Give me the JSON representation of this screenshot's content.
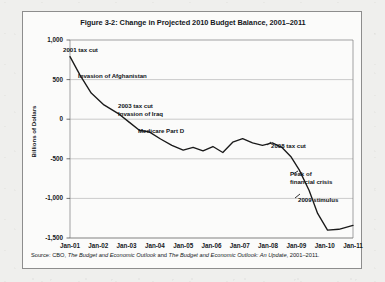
{
  "figure": {
    "title": "Figure 3-2: Change in Projected 2010 Budget Balance, 2001–2011",
    "source_prefix": "Source: CBO, ",
    "source_italic_1": "The Budget and Economic Outlook",
    "source_mid": " and ",
    "source_italic_2": "The Budget and Economic Outlook: An Update",
    "source_suffix": ", 2001–2011."
  },
  "chart_data": {
    "type": "line",
    "title": "Figure 3-2: Change in Projected 2010 Budget Balance, 2001–2011",
    "xlabel": "",
    "ylabel": "Billions of Dollars",
    "ylim": [
      -1500,
      1000
    ],
    "xlim": [
      "Jan-01",
      "Jan-11"
    ],
    "grid": true,
    "legend": "none",
    "line_color": "#1a1a1a",
    "ytick_labels": [
      "1,000",
      "500",
      "0",
      "-500",
      "-1,000",
      "-1,500"
    ],
    "ytick_values": [
      1000,
      500,
      0,
      -500,
      -1000,
      -1500
    ],
    "xtick_labels": [
      "Jan-01",
      "Jan-02",
      "Jan-03",
      "Jan-04",
      "Jan-05",
      "Jan-06",
      "Jan-07",
      "Jan-08",
      "Jan-09",
      "Jan-10",
      "Jan-11"
    ],
    "x": [
      2001.0,
      2001.35,
      2001.75,
      2002.2,
      2002.75,
      2003.1,
      2003.45,
      2003.8,
      2004.2,
      2004.6,
      2005.0,
      2005.35,
      2005.7,
      2006.05,
      2006.4,
      2006.75,
      2007.1,
      2007.45,
      2007.8,
      2008.15,
      2008.5,
      2008.8,
      2009.1,
      2009.45,
      2009.75,
      2010.1,
      2010.5,
      2011.0
    ],
    "values": [
      790,
      560,
      330,
      180,
      60,
      -40,
      -140,
      -160,
      -250,
      -330,
      -390,
      -355,
      -400,
      -345,
      -420,
      -290,
      -245,
      -300,
      -330,
      -300,
      -360,
      -470,
      -640,
      -900,
      -1190,
      -1400,
      -1390,
      -1340
    ],
    "annotations": [
      {
        "label": "2001 tax cut",
        "x_px": 62,
        "y_px": 34
      },
      {
        "label": "Invasion of Afghanistan",
        "x_px": 77,
        "y_px": 60
      },
      {
        "label": "2003 tax cut",
        "x_px": 117,
        "y_px": 90
      },
      {
        "label": "Invasion of Iraq",
        "x_px": 117,
        "y_px": 98
      },
      {
        "label": "Medicare Part D",
        "x_px": 137,
        "y_px": 115
      },
      {
        "label": "2008 tax cut",
        "x_px": 270,
        "y_px": 130
      },
      {
        "label": "Peak of",
        "x_px": 289,
        "y_px": 158
      },
      {
        "label": "financial crisis",
        "x_px": 289,
        "y_px": 166
      },
      {
        "label": "2009 stimulus",
        "x_px": 297,
        "y_px": 184
      }
    ]
  }
}
